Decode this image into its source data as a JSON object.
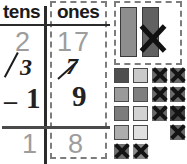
{
  "worksheet": {
    "kind": "subtraction-with-regrouping",
    "chart": {
      "headers": {
        "tens": "tens",
        "ones": "ones"
      },
      "printed_top": {
        "tens": "2",
        "ones": "17"
      },
      "regrouped": {
        "tens": "3",
        "ones": "7"
      },
      "subtrahend": {
        "sign": "–",
        "tens": "1",
        "ones": "9"
      },
      "answer": {
        "tens": "1",
        "ones": "8"
      }
    },
    "blocks": {
      "rods": [
        {
          "name": "rod-1",
          "color": "#8e8e8e",
          "crossed_out": false
        },
        {
          "name": "rod-2",
          "color": "#616161",
          "crossed_out": true
        }
      ],
      "cube_columns": [
        {
          "name": "cube-col-1",
          "cells": [
            {
              "color": "#4f4f4f",
              "crossed_out": false
            },
            {
              "color": "#9a9a9a",
              "crossed_out": false
            },
            {
              "color": "#7c7c7c",
              "crossed_out": false
            },
            {
              "color": "#adadad",
              "crossed_out": false
            },
            {
              "color": "#6e6e6e",
              "crossed_out": true
            }
          ]
        },
        {
          "name": "cube-col-2",
          "cells": [
            {
              "color": "#c9c9c9",
              "crossed_out": false
            },
            {
              "color": "#7f7f7f",
              "crossed_out": false
            },
            {
              "color": "#d2d2d2",
              "crossed_out": false
            },
            {
              "color": "#e0e0e0",
              "crossed_out": false
            },
            {
              "color": "#8a8a8a",
              "crossed_out": true
            }
          ]
        },
        {
          "name": "cube-col-3",
          "cells": [
            {
              "color": "#6a6a6a",
              "crossed_out": true
            },
            {
              "color": "#6a6a6a",
              "crossed_out": true
            },
            {
              "color": "#6a6a6a",
              "crossed_out": true
            }
          ]
        },
        {
          "name": "cube-col-4",
          "cells": [
            {
              "color": "#6a6a6a",
              "crossed_out": true
            },
            {
              "color": "#6a6a6a",
              "crossed_out": true
            },
            {
              "color": "#4a4a4a",
              "crossed_out": true
            },
            {
              "color": "#6a6a6a",
              "crossed_out": true
            }
          ]
        }
      ]
    }
  },
  "colors": {
    "ink_dark": "#222222",
    "printed_faded": "#9d9d9d",
    "rule": "#2b2b2b",
    "dashed_border": "#7d7d7d"
  }
}
